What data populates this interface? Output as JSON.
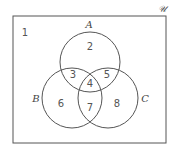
{
  "diagram": {
    "type": "venn-3-set",
    "universe": {
      "label": "𝒰",
      "x": 13,
      "y": 16,
      "width": 153,
      "height": 127,
      "label_x": 158,
      "label_y": 12
    },
    "stroke_color": "#555555",
    "background": "#ffffff",
    "sets": [
      {
        "id": "A",
        "label": "A",
        "cx": 90,
        "cy": 62,
        "r": 30,
        "label_x": 89,
        "label_y": 28
      },
      {
        "id": "B",
        "label": "B",
        "cx": 72,
        "cy": 98,
        "r": 30,
        "label_x": 36,
        "label_y": 102
      },
      {
        "id": "C",
        "label": "C",
        "cx": 108,
        "cy": 98,
        "r": 30,
        "label_x": 145,
        "label_y": 102
      }
    ],
    "regions": [
      {
        "number": "1",
        "description": "outside A, B, C",
        "x": 25,
        "y": 36
      },
      {
        "number": "2",
        "description": "A only",
        "x": 90,
        "y": 50
      },
      {
        "number": "3",
        "description": "A and B only",
        "x": 73,
        "y": 78
      },
      {
        "number": "4",
        "description": "A and B and C",
        "x": 90,
        "y": 87
      },
      {
        "number": "5",
        "description": "A and C only",
        "x": 107,
        "y": 78
      },
      {
        "number": "6",
        "description": "B only",
        "x": 61,
        "y": 107
      },
      {
        "number": "7",
        "description": "B and C only",
        "x": 90,
        "y": 111
      },
      {
        "number": "8",
        "description": "C only",
        "x": 117,
        "y": 107
      }
    ]
  }
}
